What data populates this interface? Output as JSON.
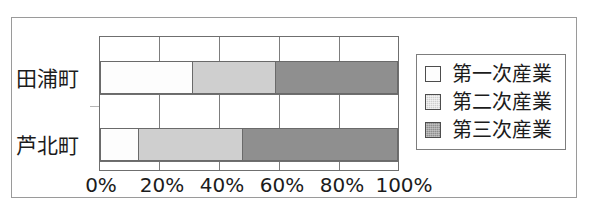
{
  "chart_data": {
    "type": "bar",
    "orientation": "horizontal",
    "stacked": true,
    "normalized_percent": true,
    "title": "",
    "xlabel": "",
    "ylabel": "",
    "categories": [
      "田浦町",
      "芦北町"
    ],
    "series": [
      {
        "name": "第一次産業",
        "values": [
          31,
          13
        ],
        "color": "#fdfdfd"
      },
      {
        "name": "第二次産業",
        "values": [
          28,
          35
        ],
        "color": "#cfcfcf"
      },
      {
        "name": "第三次産業",
        "values": [
          41,
          52
        ],
        "color": "#8f8f8f"
      }
    ],
    "xlim": [
      0,
      100
    ],
    "xticks": [
      0,
      20,
      40,
      60,
      80,
      100
    ],
    "xtick_labels": [
      "0%",
      "20%",
      "40%",
      "60%",
      "80%",
      "100%"
    ],
    "grid": true,
    "legend_position": "right"
  },
  "axis": {
    "ticks": [
      {
        "label": "0%",
        "value": 0
      },
      {
        "label": "20%",
        "value": 20
      },
      {
        "label": "40%",
        "value": 40
      },
      {
        "label": "60%",
        "value": 60
      },
      {
        "label": "80%",
        "value": 80
      },
      {
        "label": "100%",
        "value": 100
      }
    ]
  },
  "categories": [
    {
      "label": "田浦町"
    },
    {
      "label": "芦北町"
    }
  ],
  "legend": {
    "items": [
      {
        "label": "第一次産業",
        "swatch": "white-square-swatch"
      },
      {
        "label": "第二次産業",
        "swatch": "light-gray-square-swatch"
      },
      {
        "label": "第三次産業",
        "swatch": "dark-gray-square-swatch"
      }
    ]
  },
  "colors": {
    "primary_industry": "#fdfdfd",
    "secondary_industry": "#cfcfcf",
    "tertiary_industry": "#8f8f8f",
    "frame": "#9a9a9a",
    "axis": "#6f6f6f",
    "text": "#1c1c1c"
  }
}
